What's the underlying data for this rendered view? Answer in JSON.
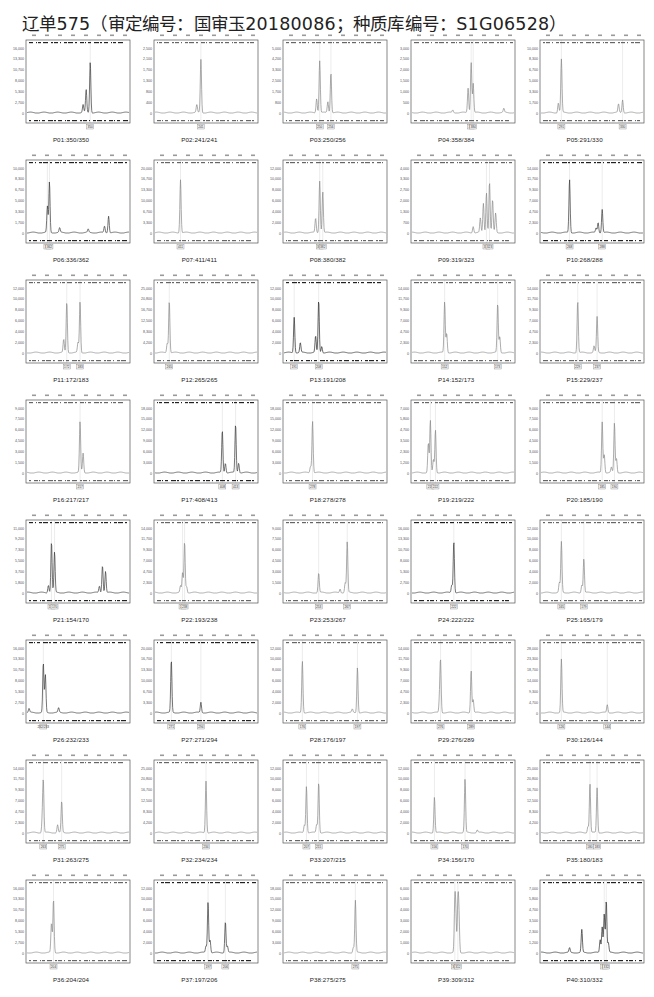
{
  "title": "辽单575（审定编号：国审玉20180086；种质库编号：S1G06528）",
  "chart_data": {
    "type": "line",
    "layout": {
      "rows": 8,
      "cols": 5,
      "grid": false,
      "legend": "none"
    },
    "panels": [
      {
        "id": "P01",
        "label": "P01:350/350",
        "alleles": [
          "350"
        ],
        "color": "#3a3a3a",
        "ymax": 16000,
        "peaks": [
          {
            "x": 0.62,
            "h": 0.78
          },
          {
            "x": 0.58,
            "h": 0.35
          },
          {
            "x": 0.55,
            "h": 0.12
          }
        ]
      },
      {
        "id": "P02",
        "label": "P02:241/241",
        "alleles": [
          "241"
        ],
        "color": "#8a8a8a",
        "ymax": 2500,
        "peaks": [
          {
            "x": 0.45,
            "h": 0.82
          },
          {
            "x": 0.41,
            "h": 0.12
          }
        ]
      },
      {
        "id": "P03",
        "label": "P03:250/256",
        "alleles": [
          "250",
          "256"
        ],
        "color": "#8a8a8a",
        "ymax": 5000,
        "peaks": [
          {
            "x": 0.35,
            "h": 0.8
          },
          {
            "x": 0.46,
            "h": 0.62
          },
          {
            "x": 0.32,
            "h": 0.22
          },
          {
            "x": 0.43,
            "h": 0.17
          }
        ]
      },
      {
        "id": "P04",
        "label": "P04:358/384",
        "alleles": [
          "358",
          "384"
        ],
        "color": "#8a8a8a",
        "ymax": 3000,
        "peaks": [
          {
            "x": 0.58,
            "h": 0.78
          },
          {
            "x": 0.55,
            "h": 0.38
          },
          {
            "x": 0.6,
            "h": 0.45
          },
          {
            "x": 0.9,
            "h": 0.06
          },
          {
            "x": 0.4,
            "h": 0.04
          }
        ]
      },
      {
        "id": "P05",
        "label": "P05:291/330",
        "alleles": [
          "291",
          "330"
        ],
        "color": "#8a8a8a",
        "ymax": 10000,
        "peaks": [
          {
            "x": 0.2,
            "h": 0.82
          },
          {
            "x": 0.17,
            "h": 0.15
          },
          {
            "x": 0.8,
            "h": 0.2
          },
          {
            "x": 0.76,
            "h": 0.13
          }
        ]
      },
      {
        "id": "P06",
        "label": "P06:336/362",
        "alleles": [
          "336",
          "362"
        ],
        "color": "#3a3a3a",
        "ymax": 10000,
        "peaks": [
          {
            "x": 0.22,
            "h": 0.78
          },
          {
            "x": 0.2,
            "h": 0.4
          },
          {
            "x": 0.8,
            "h": 0.26
          },
          {
            "x": 0.76,
            "h": 0.1
          },
          {
            "x": 0.32,
            "h": 0.07
          },
          {
            "x": 0.6,
            "h": 0.05
          }
        ]
      },
      {
        "id": "P07",
        "label": "P07:411/411",
        "alleles": [
          "411"
        ],
        "color": "#8a8a8a",
        "ymax": 20000,
        "peaks": [
          {
            "x": 0.25,
            "h": 0.82
          }
        ]
      },
      {
        "id": "P08",
        "label": "P08:380/382",
        "alleles": [
          "380",
          "382"
        ],
        "color": "#8a8a8a",
        "ymax": 12000,
        "peaks": [
          {
            "x": 0.35,
            "h": 0.8
          },
          {
            "x": 0.38,
            "h": 0.63
          },
          {
            "x": 0.31,
            "h": 0.22
          }
        ]
      },
      {
        "id": "P09",
        "label": "P09:319/323",
        "alleles": [
          "319",
          "323"
        ],
        "color": "#8a8a8a",
        "ymax": 4000,
        "peaks": [
          {
            "x": 0.76,
            "h": 0.78
          },
          {
            "x": 0.73,
            "h": 0.62
          },
          {
            "x": 0.7,
            "h": 0.45
          },
          {
            "x": 0.79,
            "h": 0.5
          },
          {
            "x": 0.67,
            "h": 0.22
          },
          {
            "x": 0.82,
            "h": 0.3
          },
          {
            "x": 0.6,
            "h": 0.1
          }
        ]
      },
      {
        "id": "P10",
        "label": "P10:268/288",
        "alleles": [
          "268",
          "288"
        ],
        "color": "#3a3a3a",
        "ymax": 14000,
        "peaks": [
          {
            "x": 0.28,
            "h": 0.82
          },
          {
            "x": 0.6,
            "h": 0.36
          },
          {
            "x": 0.56,
            "h": 0.16
          },
          {
            "x": 0.54,
            "h": 0.07
          }
        ]
      },
      {
        "id": "P11",
        "label": "P11:172/183",
        "alleles": [
          "172",
          "183"
        ],
        "color": "#8a8a8a",
        "ymax": 12000,
        "peaks": [
          {
            "x": 0.39,
            "h": 0.78
          },
          {
            "x": 0.52,
            "h": 0.78
          },
          {
            "x": 0.36,
            "h": 0.2
          },
          {
            "x": 0.5,
            "h": 0.15
          }
        ]
      },
      {
        "id": "P12",
        "label": "P12:265/265",
        "alleles": [
          "265"
        ],
        "color": "#8a8a8a",
        "ymax": 25000,
        "peaks": [
          {
            "x": 0.14,
            "h": 0.8
          },
          {
            "x": 0.12,
            "h": 0.15
          }
        ]
      },
      {
        "id": "P13",
        "label": "P13:191/208",
        "alleles": [
          "191",
          "208"
        ],
        "color": "#2a2a2a",
        "ymax": 12000,
        "peaks": [
          {
            "x": 0.1,
            "h": 0.55
          },
          {
            "x": 0.34,
            "h": 0.8
          },
          {
            "x": 0.31,
            "h": 0.25
          },
          {
            "x": 0.16,
            "h": 0.15
          },
          {
            "x": 0.37,
            "h": 0.1
          }
        ]
      },
      {
        "id": "P14",
        "label": "P14:152/173",
        "alleles": [
          "152",
          "173"
        ],
        "color": "#8a8a8a",
        "ymax": 14000,
        "peaks": [
          {
            "x": 0.32,
            "h": 0.78
          },
          {
            "x": 0.84,
            "h": 0.75
          },
          {
            "x": 0.34,
            "h": 0.3
          },
          {
            "x": 0.86,
            "h": 0.25
          }
        ]
      },
      {
        "id": "P15",
        "label": "P15:229/237",
        "alleles": [
          "229",
          "237"
        ],
        "color": "#8a8a8a",
        "ymax": 14000,
        "peaks": [
          {
            "x": 0.36,
            "h": 0.8
          },
          {
            "x": 0.55,
            "h": 0.55
          },
          {
            "x": 0.52,
            "h": 0.1
          }
        ]
      },
      {
        "id": "P16",
        "label": "P16:217/217",
        "alleles": [
          "217"
        ],
        "color": "#8a8a8a",
        "ymax": 9000,
        "peaks": [
          {
            "x": 0.52,
            "h": 0.78
          },
          {
            "x": 0.55,
            "h": 0.3
          }
        ]
      },
      {
        "id": "P17",
        "label": "P17:408/413",
        "alleles": [
          "408",
          "413"
        ],
        "color": "#3a3a3a",
        "ymax": 18000,
        "peaks": [
          {
            "x": 0.66,
            "h": 0.65
          },
          {
            "x": 0.79,
            "h": 0.74
          },
          {
            "x": 0.69,
            "h": 0.15
          },
          {
            "x": 0.82,
            "h": 0.15
          }
        ]
      },
      {
        "id": "P18",
        "label": "P18:278/278",
        "alleles": [
          "278"
        ],
        "color": "#8a8a8a",
        "ymax": 18000,
        "peaks": [
          {
            "x": 0.28,
            "h": 0.8
          },
          {
            "x": 0.26,
            "h": 0.1
          }
        ]
      },
      {
        "id": "P19",
        "label": "P19:219/222",
        "alleles": [
          "219",
          "222"
        ],
        "color": "#8a8a8a",
        "ymax": 7000,
        "peaks": [
          {
            "x": 0.18,
            "h": 0.8
          },
          {
            "x": 0.23,
            "h": 0.66
          },
          {
            "x": 0.16,
            "h": 0.45
          },
          {
            "x": 0.21,
            "h": 0.2
          }
        ]
      },
      {
        "id": "P20",
        "label": "P20:185/190",
        "alleles": [
          "185",
          "190"
        ],
        "color": "#8a8a8a",
        "ymax": 9000,
        "peaks": [
          {
            "x": 0.6,
            "h": 0.78
          },
          {
            "x": 0.72,
            "h": 0.76
          },
          {
            "x": 0.62,
            "h": 0.28
          },
          {
            "x": 0.74,
            "h": 0.22
          },
          {
            "x": 0.69,
            "h": 0.08
          }
        ]
      },
      {
        "id": "P21",
        "label": "P21:154/170",
        "alleles": [
          "154",
          "170"
        ],
        "color": "#3a3a3a",
        "ymax": 11000,
        "peaks": [
          {
            "x": 0.24,
            "h": 0.78
          },
          {
            "x": 0.27,
            "h": 0.62
          },
          {
            "x": 0.74,
            "h": 0.42
          },
          {
            "x": 0.77,
            "h": 0.33
          },
          {
            "x": 0.21,
            "h": 0.12
          },
          {
            "x": 0.71,
            "h": 0.1
          }
        ]
      },
      {
        "id": "P22",
        "label": "P22:193/238",
        "alleles": [
          "193",
          "238"
        ],
        "color": "#8a8a8a",
        "ymax": 14000,
        "peaks": [
          {
            "x": 0.29,
            "h": 0.78
          },
          {
            "x": 0.27,
            "h": 0.3
          },
          {
            "x": 0.25,
            "h": 0.1
          },
          {
            "x": 0.31,
            "h": 0.1
          }
        ]
      },
      {
        "id": "P23",
        "label": "P23:253/267",
        "alleles": [
          "253",
          "267"
        ],
        "color": "#8a8a8a",
        "ymax": 9000,
        "peaks": [
          {
            "x": 0.34,
            "h": 0.3
          },
          {
            "x": 0.62,
            "h": 0.78
          },
          {
            "x": 0.6,
            "h": 0.15
          },
          {
            "x": 0.55,
            "h": 0.06
          }
        ]
      },
      {
        "id": "P24",
        "label": "P24:222/222",
        "alleles": [
          "222"
        ],
        "color": "#3a3a3a",
        "ymax": 16000,
        "peaks": [
          {
            "x": 0.41,
            "h": 0.8
          },
          {
            "x": 0.39,
            "h": 0.12
          }
        ]
      },
      {
        "id": "P25",
        "label": "P25:165/179",
        "alleles": [
          "165",
          "179"
        ],
        "color": "#8a8a8a",
        "ymax": 12000,
        "peaks": [
          {
            "x": 0.2,
            "h": 0.78
          },
          {
            "x": 0.42,
            "h": 0.52
          },
          {
            "x": 0.18,
            "h": 0.15
          },
          {
            "x": 0.4,
            "h": 0.12
          }
        ]
      },
      {
        "id": "P26",
        "label": "P26:232/233",
        "alleles": [
          "232/233"
        ],
        "color": "#3a3a3a",
        "ymax": 16000,
        "peaks": [
          {
            "x": 0.16,
            "h": 0.76
          },
          {
            "x": 0.18,
            "h": 0.58
          },
          {
            "x": 0.31,
            "h": 0.07
          },
          {
            "x": 0.02,
            "h": 0.06
          }
        ]
      },
      {
        "id": "P27",
        "label": "P27:271/294",
        "alleles": [
          "271",
          "294"
        ],
        "color": "#3a3a3a",
        "ymax": 20000,
        "peaks": [
          {
            "x": 0.16,
            "h": 0.8
          },
          {
            "x": 0.45,
            "h": 0.16
          }
        ]
      },
      {
        "id": "P28",
        "label": "P28:176/197",
        "alleles": [
          "176",
          "197"
        ],
        "color": "#8a8a8a",
        "ymax": 12000,
        "peaks": [
          {
            "x": 0.18,
            "h": 0.8
          },
          {
            "x": 0.72,
            "h": 0.7
          },
          {
            "x": 0.67,
            "h": 0.05
          }
        ]
      },
      {
        "id": "P29",
        "label": "P29:276/289",
        "alleles": [
          "276",
          "289"
        ],
        "color": "#8a8a8a",
        "ymax": 14000,
        "peaks": [
          {
            "x": 0.28,
            "h": 0.78
          },
          {
            "x": 0.58,
            "h": 0.65
          },
          {
            "x": 0.27,
            "h": 0.2
          },
          {
            "x": 0.6,
            "h": 0.2
          }
        ]
      },
      {
        "id": "P30",
        "label": "P30:126/144",
        "alleles": [
          "126",
          "144"
        ],
        "color": "#8a8a8a",
        "ymax": 28000,
        "peaks": [
          {
            "x": 0.2,
            "h": 0.82
          },
          {
            "x": 0.65,
            "h": 0.12
          }
        ]
      },
      {
        "id": "P31",
        "label": "P31:263/275",
        "alleles": [
          "263",
          "275"
        ],
        "color": "#8a8a8a",
        "ymax": 14000,
        "peaks": [
          {
            "x": 0.16,
            "h": 0.78
          },
          {
            "x": 0.34,
            "h": 0.48
          },
          {
            "x": 0.15,
            "h": 0.2
          },
          {
            "x": 0.3,
            "h": 0.12
          }
        ]
      },
      {
        "id": "P32",
        "label": "P32:234/234",
        "alleles": [
          "234"
        ],
        "color": "#8a8a8a",
        "ymax": 25000,
        "peaks": [
          {
            "x": 0.5,
            "h": 0.8
          }
        ]
      },
      {
        "id": "P33",
        "label": "P33:207/215",
        "alleles": [
          "207",
          "215"
        ],
        "color": "#8a8a8a",
        "ymax": 12000,
        "peaks": [
          {
            "x": 0.22,
            "h": 0.72
          },
          {
            "x": 0.34,
            "h": 0.78
          },
          {
            "x": 0.2,
            "h": 0.12
          },
          {
            "x": 0.32,
            "h": 0.12
          }
        ]
      },
      {
        "id": "P34",
        "label": "P34:156/170",
        "alleles": [
          "156",
          "170"
        ],
        "color": "#8a8a8a",
        "ymax": 12000,
        "peaks": [
          {
            "x": 0.22,
            "h": 0.55
          },
          {
            "x": 0.52,
            "h": 0.82
          },
          {
            "x": 0.64,
            "h": 0.04
          }
        ]
      },
      {
        "id": "P35",
        "label": "P35:180/183",
        "alleles": [
          "180",
          "183"
        ],
        "color": "#8a8a8a",
        "ymax": 25000,
        "peaks": [
          {
            "x": 0.48,
            "h": 0.75
          },
          {
            "x": 0.55,
            "h": 0.69
          },
          {
            "x": 0.46,
            "h": 0.1
          }
        ]
      },
      {
        "id": "P36",
        "label": "P36:204/204",
        "alleles": [
          "204"
        ],
        "color": "#8a8a8a",
        "ymax": 16000,
        "peaks": [
          {
            "x": 0.26,
            "h": 0.82
          },
          {
            "x": 0.24,
            "h": 0.45
          }
        ]
      },
      {
        "id": "P37",
        "label": "P37:197/206",
        "alleles": [
          "197",
          "206"
        ],
        "color": "#3a3a3a",
        "ymax": 12000,
        "peaks": [
          {
            "x": 0.52,
            "h": 0.78
          },
          {
            "x": 0.69,
            "h": 0.48
          },
          {
            "x": 0.54,
            "h": 0.2
          },
          {
            "x": 0.5,
            "h": 0.1
          },
          {
            "x": 0.71,
            "h": 0.1
          }
        ]
      },
      {
        "id": "P38",
        "label": "P38:275/275",
        "alleles": [
          "275"
        ],
        "color": "#8a8a8a",
        "ymax": 18000,
        "peaks": [
          {
            "x": 0.7,
            "h": 0.8
          },
          {
            "x": 0.68,
            "h": 0.08
          }
        ]
      },
      {
        "id": "P39",
        "label": "P39:309/312",
        "alleles": [
          "309",
          "312"
        ],
        "color": "#8a8a8a",
        "ymax": 6000,
        "peaks": [
          {
            "x": 0.42,
            "h": 0.76
          },
          {
            "x": 0.45,
            "h": 0.75
          },
          {
            "x": 0.43,
            "h": 0.52
          },
          {
            "x": 0.46,
            "h": 0.55
          }
        ]
      },
      {
        "id": "P40",
        "label": "P40:310/332",
        "alleles": [
          "310",
          "332"
        ],
        "color": "#2a2a2a",
        "ymax": 7000,
        "peaks": [
          {
            "x": 0.4,
            "h": 0.35
          },
          {
            "x": 0.64,
            "h": 0.8
          },
          {
            "x": 0.62,
            "h": 0.6
          },
          {
            "x": 0.6,
            "h": 0.4
          },
          {
            "x": 0.58,
            "h": 0.2
          },
          {
            "x": 0.66,
            "h": 0.15
          },
          {
            "x": 0.28,
            "h": 0.07
          }
        ]
      }
    ]
  }
}
